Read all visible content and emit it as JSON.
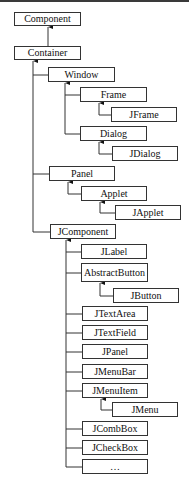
{
  "diagram": {
    "type": "class-hierarchy-tree",
    "edge_style": "inheritance-arrow-to-parent",
    "line_color": "#333333",
    "nodes": [
      {
        "id": "component",
        "label": "Component",
        "parent": null,
        "x": 14,
        "y": 12,
        "w": 67,
        "h": 14
      },
      {
        "id": "container",
        "label": "Container",
        "parent": "component",
        "x": 14,
        "y": 46,
        "w": 67,
        "h": 14
      },
      {
        "id": "window",
        "label": "Window",
        "parent": "container",
        "x": 48,
        "y": 67,
        "w": 67,
        "h": 15
      },
      {
        "id": "frame",
        "label": "Frame",
        "parent": "window",
        "x": 80,
        "y": 87,
        "w": 67,
        "h": 15
      },
      {
        "id": "jframe",
        "label": "JFrame",
        "parent": "frame",
        "x": 111,
        "y": 107,
        "w": 66,
        "h": 15
      },
      {
        "id": "dialog",
        "label": "Dialog",
        "parent": "window",
        "x": 80,
        "y": 126,
        "w": 67,
        "h": 15
      },
      {
        "id": "jdialog",
        "label": "JDialog",
        "parent": "dialog",
        "x": 112,
        "y": 146,
        "w": 66,
        "h": 15
      },
      {
        "id": "panel",
        "label": "Panel",
        "parent": "container",
        "x": 49,
        "y": 166,
        "w": 66,
        "h": 15
      },
      {
        "id": "applet",
        "label": "Applet",
        "parent": "panel",
        "x": 81,
        "y": 186,
        "w": 66,
        "h": 15
      },
      {
        "id": "japplet",
        "label": "JApplet",
        "parent": "applet",
        "x": 115,
        "y": 205,
        "w": 66,
        "h": 15
      },
      {
        "id": "jcomponent",
        "label": "JComponent",
        "parent": "container",
        "x": 50,
        "y": 224,
        "w": 66,
        "h": 15
      },
      {
        "id": "jlabel",
        "label": "JLabel",
        "parent": "jcomponent",
        "x": 81,
        "y": 244,
        "w": 66,
        "h": 15
      },
      {
        "id": "abstractbutton",
        "label": "AbstractButton",
        "parent": "jcomponent",
        "x": 81,
        "y": 263,
        "w": 67,
        "h": 19
      },
      {
        "id": "jbutton",
        "label": "JButton",
        "parent": "abstractbutton",
        "x": 113,
        "y": 288,
        "w": 66,
        "h": 15
      },
      {
        "id": "jtextarea",
        "label": "JTextArea",
        "parent": "jcomponent",
        "x": 82,
        "y": 306,
        "w": 66,
        "h": 15
      },
      {
        "id": "jtextfield",
        "label": "JTextField",
        "parent": "jcomponent",
        "x": 82,
        "y": 325,
        "w": 66,
        "h": 15
      },
      {
        "id": "jpanel",
        "label": "JPanel",
        "parent": "jcomponent",
        "x": 82,
        "y": 344,
        "w": 66,
        "h": 15
      },
      {
        "id": "jmenubar",
        "label": "JMenuBar",
        "parent": "jcomponent",
        "x": 82,
        "y": 364,
        "w": 66,
        "h": 15
      },
      {
        "id": "jmenuitem",
        "label": "JMenuItem",
        "parent": "jcomponent",
        "x": 82,
        "y": 383,
        "w": 66,
        "h": 15
      },
      {
        "id": "jmenu",
        "label": "JMenu",
        "parent": "jmenuitem",
        "x": 112,
        "y": 402,
        "w": 66,
        "h": 15
      },
      {
        "id": "jcombbox",
        "label": "JCombBox",
        "parent": "jcomponent",
        "x": 82,
        "y": 421,
        "w": 66,
        "h": 15
      },
      {
        "id": "jcheckbox",
        "label": "JCheckBox",
        "parent": "jcomponent",
        "x": 82,
        "y": 440,
        "w": 66,
        "h": 15
      },
      {
        "id": "more",
        "label": "…",
        "parent": "jcomponent",
        "x": 82,
        "y": 459,
        "w": 66,
        "h": 15
      }
    ]
  }
}
